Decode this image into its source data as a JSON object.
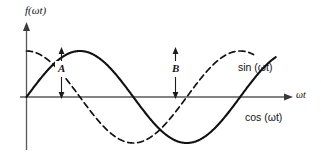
{
  "figure": {
    "title": "",
    "background_color": "#ffffff",
    "axis_color": "#58585a",
    "curve_color": "#111111"
  },
  "labels": {
    "y_axis": "f(ωt)",
    "x_axis": "ωt",
    "sin_curve": "sin (ωt)",
    "cos_curve": "cos (ωt)",
    "marker_a": "A",
    "marker_b": "B"
  },
  "chart_data": {
    "type": "line",
    "title": "",
    "xlabel": "ωt",
    "ylabel": "f(ωt)",
    "grid": false,
    "legend_position": "inline-right",
    "xlim": [
      0,
      7.6
    ],
    "ylim": [
      -1.25,
      1.25
    ],
    "x_unit": "radians",
    "amplitude": 1,
    "series": [
      {
        "name": "sin (ωt)",
        "style": "solid",
        "color": "#111111",
        "function": "sin",
        "phase": 0,
        "x": [
          0,
          0.393,
          0.785,
          1.178,
          1.571,
          1.963,
          2.356,
          2.749,
          3.142,
          3.534,
          3.927,
          4.32,
          4.712,
          5.105,
          5.498,
          5.89,
          6.283,
          6.676,
          7.069,
          7.33
        ],
        "values": [
          0,
          0.383,
          0.707,
          0.924,
          1,
          0.924,
          0.707,
          0.383,
          0,
          -0.383,
          -0.707,
          -0.924,
          -1,
          -0.924,
          -0.707,
          -0.383,
          0,
          0.383,
          0.707,
          0.866
        ]
      },
      {
        "name": "cos (ωt)",
        "style": "dashed",
        "color": "#111111",
        "function": "cos",
        "phase": 1.571,
        "x": [
          0,
          0.393,
          0.785,
          1.178,
          1.571,
          1.963,
          2.356,
          2.749,
          3.142,
          3.534,
          3.927,
          4.32,
          4.712,
          5.105,
          5.498,
          5.89,
          6.283,
          6.676
        ],
        "values": [
          1,
          0.924,
          0.707,
          0.383,
          0,
          -0.383,
          -0.707,
          -0.924,
          -1,
          -0.924,
          -0.707,
          -0.383,
          0,
          0.383,
          0.707,
          0.924,
          1,
          0.924
        ]
      }
    ],
    "annotations": [
      {
        "label": "A",
        "type": "amplitude-arrow",
        "series": "sin (ωt)",
        "x": 1.571,
        "from_y": 0,
        "to_y": 1,
        "description": "double-headed arrow from axis to peak of sin"
      },
      {
        "label": "B",
        "type": "amplitude-arrow",
        "series": "cos (ωt)",
        "x": 6.283,
        "from_y": 0,
        "to_y": 1,
        "description": "double-headed arrow from axis to peak of cos"
      }
    ]
  }
}
